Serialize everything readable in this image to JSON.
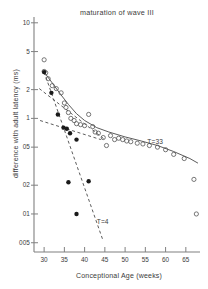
{
  "chart_data": {
    "type": "scatter",
    "title": "maturation of wave III",
    "xlabel": "Conceptional  Age (weeks)",
    "ylabel": "difference with adult latency (ms)",
    "xscale": "linear",
    "yscale": "log",
    "xlim": [
      27.5,
      68.5
    ],
    "ylim": [
      0.04,
      11.5
    ],
    "grid": false,
    "legend": "none",
    "xticks": [
      30,
      35,
      40,
      45,
      50,
      55,
      60,
      65
    ],
    "xtick_labels": [
      "30",
      "35",
      "40",
      "45",
      "50",
      "55",
      "60",
      "65"
    ],
    "yticks": [
      10,
      5,
      2,
      1,
      0.5,
      0.2,
      0.1,
      0.05
    ],
    "ytick_labels": [
      "10",
      "5",
      "2",
      "1",
      "05",
      "02",
      "01",
      "005"
    ],
    "annotations": [
      {
        "text": "T=33",
        "x": 55.5,
        "y": 0.56
      },
      {
        "text": "T=4",
        "x": 43.0,
        "y": 0.082
      }
    ],
    "series": [
      {
        "name": "open-circles",
        "marker": "open circle",
        "x": [
          30.0,
          30.0,
          30.4,
          31.0,
          32.0,
          33.0,
          34.2,
          35.0,
          35.4,
          36.0,
          36.6,
          37.4,
          38.0,
          39.0,
          40.0,
          41.0,
          42.0,
          42.6,
          43.4,
          44.6,
          45.4,
          46.4,
          47.4,
          48.4,
          49.4,
          50.4,
          51.4,
          53.0,
          54.4,
          56.0,
          58.0,
          60.0,
          62.0,
          64.6,
          67.0,
          67.6
        ],
        "y": [
          4.1,
          3.1,
          3.0,
          2.6,
          2.2,
          2.05,
          1.85,
          1.45,
          1.3,
          1.15,
          1.0,
          0.95,
          0.88,
          0.86,
          0.84,
          1.1,
          0.82,
          0.72,
          0.7,
          0.63,
          0.52,
          0.66,
          0.6,
          0.62,
          0.6,
          0.58,
          0.57,
          0.55,
          0.54,
          0.52,
          0.5,
          0.47,
          0.42,
          0.38,
          0.23,
          0.1
        ]
      },
      {
        "name": "filled-circles",
        "marker": "filled circle",
        "x": [
          30.0,
          31.8,
          33.4,
          34.8,
          35.6,
          36.4,
          38.0,
          36.0,
          38.0,
          41.0
        ],
        "y": [
          3.05,
          1.85,
          1.1,
          0.8,
          0.78,
          0.7,
          0.6,
          0.215,
          0.1,
          0.22
        ]
      }
    ],
    "fits": [
      {
        "name": "T=33 solid curve",
        "style": "solid",
        "points": [
          [
            30.0,
            3.05
          ],
          [
            32.0,
            2.35
          ],
          [
            34.0,
            1.8
          ],
          [
            36.0,
            1.4
          ],
          [
            38.0,
            1.12
          ],
          [
            40.0,
            0.95
          ],
          [
            43.0,
            0.8
          ],
          [
            46.0,
            0.72
          ],
          [
            50.0,
            0.64
          ],
          [
            54.0,
            0.58
          ],
          [
            58.0,
            0.52
          ],
          [
            62.0,
            0.45
          ],
          [
            66.0,
            0.38
          ],
          [
            68.0,
            0.34
          ]
        ]
      },
      {
        "name": "T=4 dashed line",
        "style": "dashed",
        "points": [
          [
            30.0,
            3.05
          ],
          [
            44.6,
            0.052
          ]
        ]
      },
      {
        "name": "shallow dashed line",
        "style": "dashed",
        "points": [
          [
            28.8,
            2.05
          ],
          [
            45.0,
            0.6
          ]
        ]
      },
      {
        "name": "lower dashed branch",
        "style": "dashed",
        "points": [
          [
            29.0,
            0.95
          ],
          [
            44.0,
            0.6
          ]
        ]
      }
    ]
  }
}
